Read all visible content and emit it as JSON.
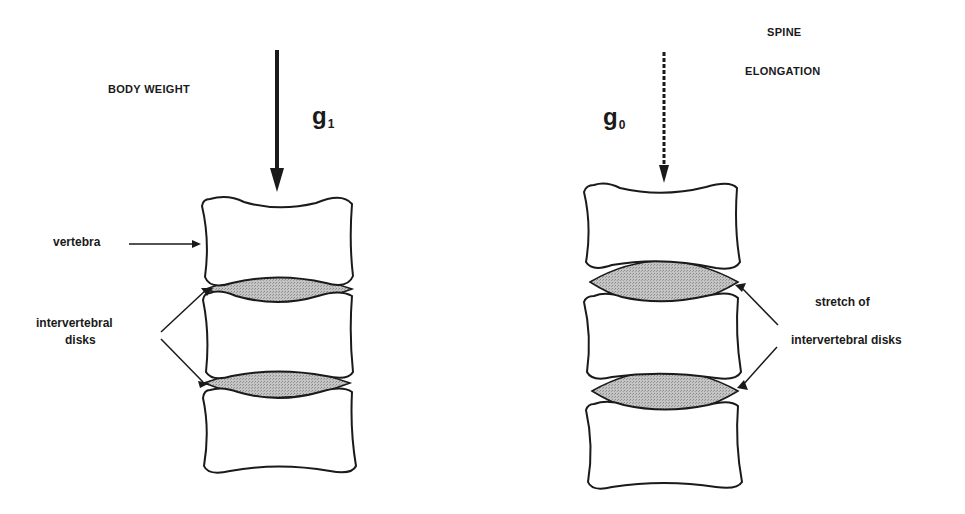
{
  "left_panel": {
    "force_label": "BODY WEIGHT",
    "gravity_symbol": "g",
    "gravity_subscript": "1",
    "vertebra_label": "vertebra",
    "disks_label_line1": "intervertebral",
    "disks_label_line2": "disks",
    "arrow_style": "solid"
  },
  "right_panel": {
    "title_line1": "SPINE",
    "title_line2": "ELONGATION",
    "gravity_symbol": "g",
    "gravity_subscript": "0",
    "stretch_label_line1": "stretch of",
    "stretch_label_line2": "intervertebral disks",
    "arrow_style": "dashed"
  },
  "colors": {
    "outline": "#1a1a1a",
    "disk_fill": "#b8b8b8",
    "background": "#ffffff"
  }
}
